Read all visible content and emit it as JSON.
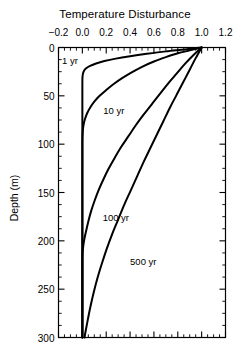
{
  "chart_data": {
    "type": "line",
    "title": "Temperature Disturbance",
    "xlabel": "Temperature Disturbance",
    "ylabel": "Depth (m)",
    "xlim": [
      -0.2,
      1.2
    ],
    "ylim": [
      0,
      300
    ],
    "y_inverted": true,
    "grid": false,
    "legend_position": "inline-annotations",
    "xticks": [
      -0.2,
      0.0,
      0.2,
      0.4,
      0.6,
      0.8,
      1.0,
      1.2
    ],
    "xticklabels": [
      "−0.2",
      "0.0",
      "0.2",
      "0.4",
      "0.6",
      "0.8",
      "1.0",
      "1.2"
    ],
    "x_minor_tick_step": 0.05,
    "yticks": [
      0,
      50,
      100,
      150,
      200,
      250,
      300
    ],
    "yticklabels": [
      "0",
      "50",
      "100",
      "150",
      "200",
      "250",
      "300"
    ],
    "y_minor_tick_step": 12.5,
    "line_color": "#000000",
    "line_width": 2.0,
    "series": [
      {
        "name": "1 yr",
        "label": "1 yr",
        "label_x": -0.17,
        "label_y": 14,
        "points": [
          [
            1.0,
            0
          ],
          [
            0.86,
            2
          ],
          [
            0.7,
            4
          ],
          [
            0.54,
            6.5
          ],
          [
            0.4,
            9
          ],
          [
            0.28,
            11.5
          ],
          [
            0.185,
            14
          ],
          [
            0.115,
            16.5
          ],
          [
            0.065,
            19
          ],
          [
            0.032,
            21.5
          ],
          [
            0.014,
            24
          ],
          [
            0.005,
            27
          ],
          [
            0.001,
            31
          ],
          [
            0.0,
            40
          ],
          [
            0.0,
            80
          ],
          [
            0.0,
            150
          ],
          [
            0.0,
            220
          ],
          [
            0.0,
            300
          ]
        ]
      },
      {
        "name": "10 yr",
        "label": "10 yr",
        "label_x": 0.175,
        "label_y": 66,
        "points": [
          [
            1.0,
            0
          ],
          [
            0.9,
            3
          ],
          [
            0.8,
            6
          ],
          [
            0.7,
            10
          ],
          [
            0.6,
            14.5
          ],
          [
            0.5,
            20
          ],
          [
            0.41,
            26
          ],
          [
            0.33,
            32
          ],
          [
            0.26,
            38
          ],
          [
            0.2,
            44
          ],
          [
            0.145,
            50
          ],
          [
            0.1,
            56
          ],
          [
            0.066,
            62
          ],
          [
            0.04,
            68
          ],
          [
            0.022,
            74
          ],
          [
            0.01,
            80
          ],
          [
            0.004,
            86
          ],
          [
            0.001,
            93
          ],
          [
            0.0,
            105
          ],
          [
            0.0,
            160
          ],
          [
            0.0,
            230
          ],
          [
            0.0,
            300
          ]
        ]
      },
      {
        "name": "100 yr",
        "label": "100 yr",
        "label_x": 0.17,
        "label_y": 176,
        "points": [
          [
            1.0,
            0
          ],
          [
            0.93,
            8
          ],
          [
            0.86,
            17
          ],
          [
            0.79,
            27
          ],
          [
            0.72,
            37
          ],
          [
            0.65,
            48
          ],
          [
            0.58,
            59
          ],
          [
            0.51,
            70
          ],
          [
            0.445,
            81
          ],
          [
            0.385,
            92
          ],
          [
            0.325,
            103
          ],
          [
            0.272,
            114
          ],
          [
            0.222,
            125
          ],
          [
            0.178,
            136
          ],
          [
            0.138,
            147
          ],
          [
            0.104,
            158
          ],
          [
            0.074,
            169
          ],
          [
            0.05,
            180
          ],
          [
            0.031,
            190
          ],
          [
            0.017,
            198
          ],
          [
            0.008,
            205
          ],
          [
            0.002,
            212
          ],
          [
            0.0,
            222
          ],
          [
            0.0,
            260
          ],
          [
            0.0,
            300
          ]
        ]
      },
      {
        "name": "500 yr",
        "label": "500 yr",
        "label_x": 0.4,
        "label_y": 222,
        "points": [
          [
            1.0,
            0
          ],
          [
            0.95,
            11
          ],
          [
            0.9,
            23
          ],
          [
            0.845,
            36
          ],
          [
            0.79,
            49
          ],
          [
            0.735,
            62
          ],
          [
            0.68,
            76
          ],
          [
            0.625,
            90
          ],
          [
            0.57,
            104
          ],
          [
            0.515,
            118
          ],
          [
            0.46,
            133
          ],
          [
            0.405,
            148
          ],
          [
            0.35,
            163
          ],
          [
            0.3,
            178
          ],
          [
            0.25,
            193
          ],
          [
            0.205,
            208
          ],
          [
            0.165,
            223
          ],
          [
            0.128,
            238
          ],
          [
            0.096,
            253
          ],
          [
            0.068,
            268
          ],
          [
            0.045,
            282
          ],
          [
            0.028,
            293
          ],
          [
            0.018,
            300
          ]
        ]
      }
    ]
  }
}
